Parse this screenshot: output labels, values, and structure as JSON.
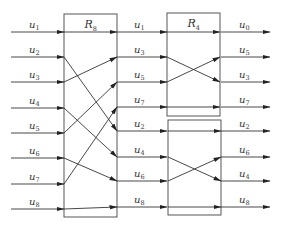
{
  "diagram": {
    "type": "butterfly-permutation-network",
    "stroke_color": "#333333",
    "boxes": [
      {
        "id": "R8",
        "label": "R",
        "sub": "8",
        "x": 64,
        "y": 14,
        "w": 53,
        "h": 203
      },
      {
        "id": "R4a",
        "label": "R",
        "sub": "4",
        "x": 167,
        "y": 13,
        "w": 53,
        "h": 103
      },
      {
        "id": "R4b",
        "label": "",
        "sub": "",
        "x": 168,
        "y": 120,
        "w": 53,
        "h": 95
      }
    ],
    "inputs": [
      {
        "label": "u",
        "sub": "1",
        "y": 32
      },
      {
        "label": "u",
        "sub": "2",
        "y": 57
      },
      {
        "label": "u",
        "sub": "3",
        "y": 82
      },
      {
        "label": "u",
        "sub": "4",
        "y": 108
      },
      {
        "label": "u",
        "sub": "5",
        "y": 133
      },
      {
        "label": "u",
        "sub": "6",
        "y": 158
      },
      {
        "label": "u",
        "sub": "7",
        "y": 184
      },
      {
        "label": "u",
        "sub": "8",
        "y": 209
      }
    ],
    "middle": [
      {
        "label": "u",
        "sub": "1",
        "y": 32
      },
      {
        "label": "u",
        "sub": "3",
        "y": 57
      },
      {
        "label": "u",
        "sub": "5",
        "y": 82
      },
      {
        "label": "u",
        "sub": "7",
        "y": 107
      },
      {
        "label": "u",
        "sub": "2",
        "y": 131
      },
      {
        "label": "u",
        "sub": "4",
        "y": 157
      },
      {
        "label": "u",
        "sub": "6",
        "y": 181
      },
      {
        "label": "u",
        "sub": "8",
        "y": 207
      }
    ],
    "outputs": [
      {
        "label": "u",
        "sub": "0",
        "y": 32
      },
      {
        "label": "u",
        "sub": "5",
        "y": 57
      },
      {
        "label": "u",
        "sub": "3",
        "y": 82
      },
      {
        "label": "u",
        "sub": "7",
        "y": 107
      },
      {
        "label": "u",
        "sub": "2",
        "y": 131
      },
      {
        "label": "u",
        "sub": "6",
        "y": 157
      },
      {
        "label": "u",
        "sub": "4",
        "y": 181
      },
      {
        "label": "u",
        "sub": "8",
        "y": 207
      }
    ],
    "r8_connections": [
      [
        32,
        32
      ],
      [
        57,
        131
      ],
      [
        82,
        57
      ],
      [
        108,
        157
      ],
      [
        133,
        82
      ],
      [
        158,
        181
      ],
      [
        184,
        107
      ],
      [
        209,
        207
      ]
    ],
    "r4a_connections": [
      [
        32,
        32
      ],
      [
        57,
        82
      ],
      [
        82,
        57
      ],
      [
        107,
        107
      ]
    ],
    "r4b_connections": [
      [
        131,
        131
      ],
      [
        157,
        181
      ],
      [
        181,
        157
      ],
      [
        207,
        207
      ]
    ]
  }
}
